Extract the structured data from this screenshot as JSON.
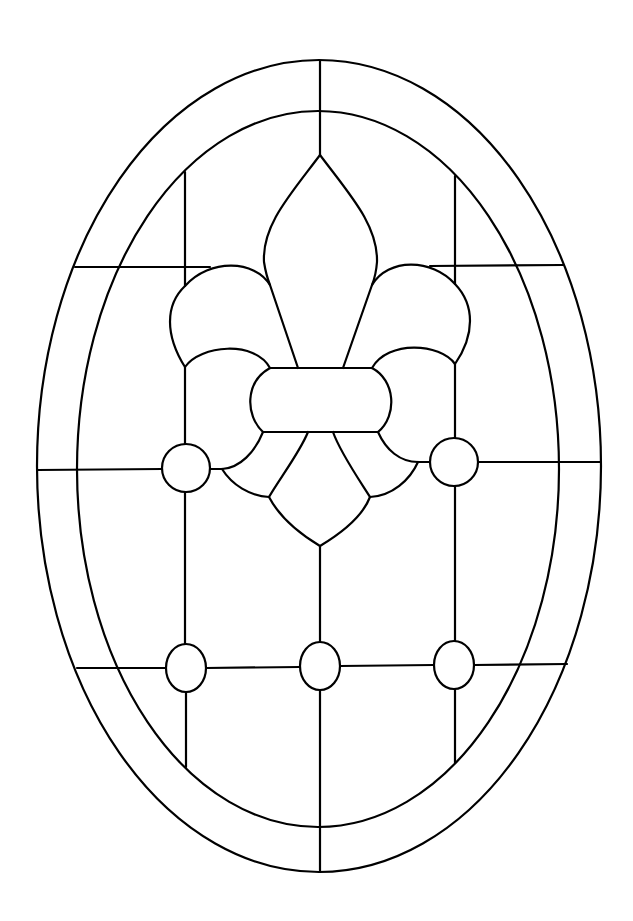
{
  "title": "Fleur-de-lis oval stained glass pattern",
  "style": {
    "background": "#ffffff",
    "line_color": "#000000"
  },
  "outer_oval": {
    "cx": 319,
    "cy": 466,
    "rx": 282,
    "ry": 406
  },
  "inner_oval": {
    "cx": 318,
    "cy": 469,
    "rx": 241,
    "ry": 358
  },
  "lead_lines": {
    "vertical_x": [
      185,
      320,
      455
    ],
    "horizontal_y": [
      267,
      468,
      667
    ]
  },
  "jewels": [
    {
      "name": "jewel-middle-left",
      "cx": 186,
      "cy": 468,
      "rx": 24,
      "ry": 24
    },
    {
      "name": "jewel-middle-right",
      "cx": 454,
      "cy": 462,
      "rx": 24,
      "ry": 24
    },
    {
      "name": "jewel-bottom-left",
      "cx": 186,
      "cy": 668,
      "rx": 20,
      "ry": 24
    },
    {
      "name": "jewel-bottom-center",
      "cx": 320,
      "cy": 666,
      "rx": 20,
      "ry": 24
    },
    {
      "name": "jewel-bottom-right",
      "cx": 454,
      "cy": 665,
      "rx": 20,
      "ry": 24
    }
  ],
  "motif": "fleur-de-lis"
}
